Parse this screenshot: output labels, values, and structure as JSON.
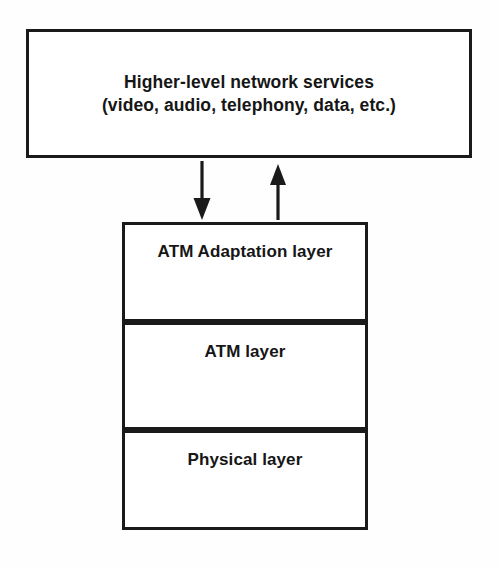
{
  "diagram": {
    "background_color": "#fefefe",
    "line_color": "#1a1a1a",
    "text_color": "#161616"
  },
  "services_box": {
    "label": "Higher-level network services\n(video, audio, telephony, data, etc.)",
    "line1": "Higher-level network services",
    "line2": "(video, audio, telephony, data, etc.)"
  },
  "stack": {
    "layers": [
      {
        "label": "ATM Adaptation layer"
      },
      {
        "label": "ATM layer"
      },
      {
        "label": "Physical layer"
      }
    ]
  },
  "arrows": [
    {
      "name": "downward-arrow",
      "direction": "down",
      "description": "services to ATM Adaptation layer"
    },
    {
      "name": "upward-arrow",
      "direction": "up",
      "description": "ATM Adaptation layer to services"
    }
  ]
}
